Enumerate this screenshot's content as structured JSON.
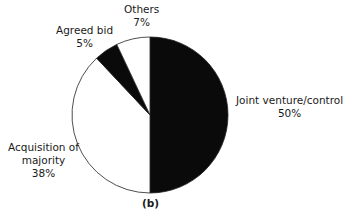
{
  "chart_data": {
    "type": "pie",
    "title": "",
    "caption": "(b)",
    "start_angle": "12 o'clock, clockwise",
    "slices": [
      {
        "label": "Joint venture/control",
        "value": 50,
        "display": "50%",
        "color": "#0a0a0a"
      },
      {
        "label": "Acquisition of majority",
        "value": 38,
        "display": "38%",
        "color": "#ffffff"
      },
      {
        "label": "Agreed bid",
        "value": 5,
        "display": "5%",
        "color": "#0a0a0a"
      },
      {
        "label": "Others",
        "value": 7,
        "display": "7%",
        "color": "#ffffff"
      }
    ]
  },
  "labels": {
    "jv_name": "Joint venture/control",
    "jv_pct": "50%",
    "acq_line1": "Acquisition of",
    "acq_line2": "majority",
    "acq_pct": "38%",
    "agreed_name": "Agreed bid",
    "agreed_pct": "5%",
    "others_name": "Others",
    "others_pct": "7%",
    "caption": "(b)"
  }
}
